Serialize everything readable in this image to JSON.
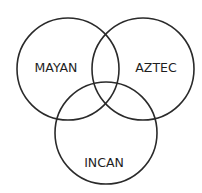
{
  "diagram": {
    "type": "venn",
    "sets": [
      {
        "id": "mayan",
        "label": "MAYAN"
      },
      {
        "id": "aztec",
        "label": "AZTEC"
      },
      {
        "id": "incan",
        "label": "INCAN"
      }
    ],
    "stroke_color": "#2a2a2a",
    "background": "#ffffff"
  }
}
